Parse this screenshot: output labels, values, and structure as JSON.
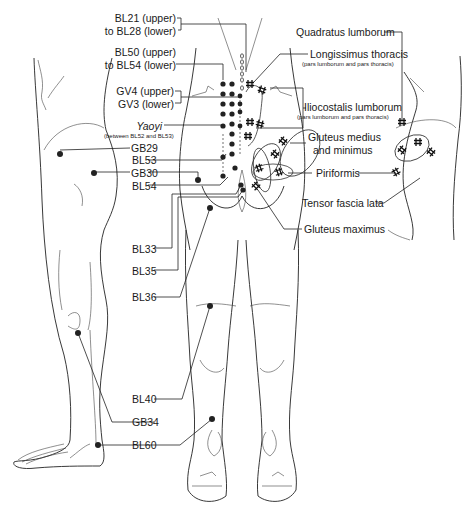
{
  "figure": {
    "views": [
      "left-lateral-leg",
      "posterior-legs",
      "right-lateral-hip"
    ]
  },
  "acupoint_labels": {
    "bl21_bl28_line1": "BL21 (upper)",
    "bl21_bl28_line2": "to BL28 (lower)",
    "bl50_bl54_line1": "BL50 (upper)",
    "bl50_bl54_line2": "to BL54 (lower)",
    "gv4": "GV4 (upper)",
    "gv3": "GV3 (lower)",
    "yaoyi": "Yaoyi",
    "yaoyi_note": "(between BL52 and BL53)",
    "gb29": "GB29",
    "bl53": "BL53",
    "gb30": "GB30",
    "bl54": "BL54",
    "bl33": "BL33",
    "bl35": "BL35",
    "bl36": "BL36",
    "bl40": "BL40",
    "gb34": "GB34",
    "bl60": "BL60"
  },
  "muscle_labels": {
    "quadratus_lumborum": "Quadratus lumborum",
    "longissimus_thoracis": "Longissimus thoracis",
    "longissimus_note": "(pars lumborum and pars thoracis)",
    "iliocostalis_lumborum": "Iliocostalis lumborum",
    "iliocostalis_note": "(pars lumborum and pars thoracis)",
    "gluteus_medius_line1": "Gluteus medius",
    "gluteus_medius_line2": "and minimus",
    "piriformis": "Piriformis",
    "tensor_fascia_lata": "Tensor fascia lata",
    "gluteus_maximus": "Gluteus maximus"
  },
  "legend": {
    "dot": "acupoint",
    "hash": "trigger point"
  },
  "colors": {
    "line": "#222222",
    "background": "#ffffff"
  }
}
